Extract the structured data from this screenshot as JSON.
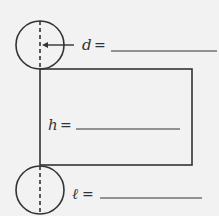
{
  "diagram": {
    "labels": {
      "diameter": {
        "var": "d",
        "eq": "="
      },
      "height": {
        "var": "h",
        "eq": "="
      },
      "length": {
        "var": "ℓ",
        "eq": "="
      }
    },
    "colors": {
      "stroke": "#333333",
      "background": "#f2f2f2"
    }
  }
}
